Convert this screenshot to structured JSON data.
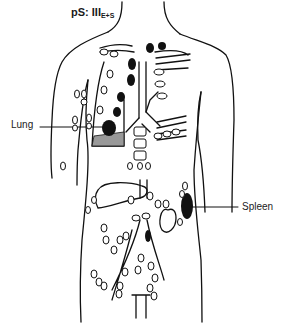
{
  "title": {
    "prefix": "pS: III",
    "subscript": "E+S"
  },
  "labels": {
    "lung": "Lung",
    "spleen": "Spleen"
  },
  "figure": {
    "stage": "III E+S",
    "involved_sites": [
      "Lung",
      "Spleen"
    ],
    "colors": {
      "line": "#111111",
      "involved_node": "#111111",
      "uninvolved_node": "#ffffff"
    }
  }
}
